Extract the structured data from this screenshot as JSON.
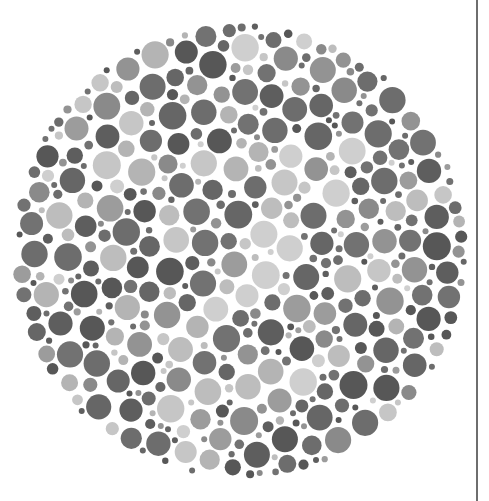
{
  "image": {
    "width": 489,
    "height": 501,
    "background": "#ffffff",
    "subject": "Ishihara color-vision test plate (grayscale)"
  },
  "plate": {
    "center_x": 240,
    "center_y": 251,
    "radius": 228,
    "dot_min_radius": 3,
    "dot_max_radius": 14,
    "dot_count_target": 900,
    "seed": 20240611,
    "colors": {
      "dark": [
        "#5e5e5e",
        "#666666",
        "#6d6d6d",
        "#575757",
        "#727272"
      ],
      "mid": [
        "#8a8a8a",
        "#939393",
        "#9c9c9c"
      ],
      "light": [
        "#b4b4b4",
        "#bdbdbd",
        "#c6c6c6",
        "#cfcfcf"
      ]
    },
    "hidden_figure": {
      "description": "lighter-tone dots forming a faint numeral-like shape in the center",
      "strokes": [
        {
          "x1": 130,
          "y1": 165,
          "x2": 330,
          "y2": 160,
          "w": 38
        },
        {
          "x1": 300,
          "y1": 170,
          "x2": 200,
          "y2": 340,
          "w": 40
        }
      ]
    }
  },
  "frame": {
    "right_line_x": 476,
    "right_line_color": "#6e6e6e"
  }
}
